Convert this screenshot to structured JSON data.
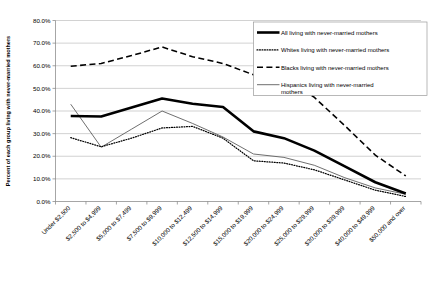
{
  "chart_data": {
    "type": "line",
    "title": "",
    "xlabel": "",
    "ylabel": "Percent of each group living with never-married mothers",
    "ylim": [
      0,
      80
    ],
    "ytick_labels": [
      "0.0%",
      "10.0%",
      "20.0%",
      "30.0%",
      "40.0%",
      "50.0%",
      "60.0%",
      "70.0%",
      "80.0%"
    ],
    "ytick_values": [
      0,
      10,
      20,
      30,
      40,
      50,
      60,
      70,
      80
    ],
    "grid": true,
    "legend_position": "top-right",
    "categories": [
      "Under $2,500",
      "$2,500 to $4,999",
      "$5,000 to $7,499",
      "$7,500 to $9,999",
      "$10,000 to $12,499",
      "$12,500 to $14,999",
      "$15,000 to $19,999",
      "$20,000 to $24,999",
      "$25,000 to $29,999",
      "$30,000 to $39,999",
      "$40,000 to $49,999",
      "$50,000 and over"
    ],
    "series": [
      {
        "name": "All living with never-married mothers",
        "style": "solid-thick",
        "values": [
          37.8,
          37.6,
          41.5,
          45.5,
          43.2,
          41.8,
          31.0,
          28.0,
          22.5,
          15.5,
          8.5,
          3.5
        ]
      },
      {
        "name": "Whites living with never-married mothers",
        "style": "dotted",
        "values": [
          28.2,
          24.2,
          28.0,
          32.5,
          33.2,
          28.0,
          18.0,
          17.0,
          14.0,
          9.5,
          5.0,
          2.2
        ]
      },
      {
        "name": "Blacks living with never-married mothers",
        "style": "dashed",
        "values": [
          59.8,
          61.0,
          64.5,
          68.3,
          64.0,
          61.0,
          56.0,
          55.5,
          46.0,
          33.5,
          20.5,
          11.3
        ]
      },
      {
        "name": "Hispanics living with never-married mothers",
        "style": "solid-thin",
        "values": [
          43.0,
          24.0,
          32.0,
          40.0,
          34.5,
          28.5,
          21.0,
          19.5,
          16.0,
          10.5,
          6.0,
          3.2
        ]
      }
    ]
  },
  "legend": {
    "items": [
      {
        "label": "All living with never-married mothers",
        "swatch": "solid-thick-line-icon"
      },
      {
        "label": "Whites living with never-married mothers",
        "swatch": "dotted-line-icon"
      },
      {
        "label": "Blacks living with never-married mothers",
        "swatch": "dashed-line-icon"
      },
      {
        "label": "Hispanics living with never-married",
        "swatch": "thin-line-icon"
      },
      {
        "label": "mothers",
        "swatch": "none"
      }
    ]
  }
}
